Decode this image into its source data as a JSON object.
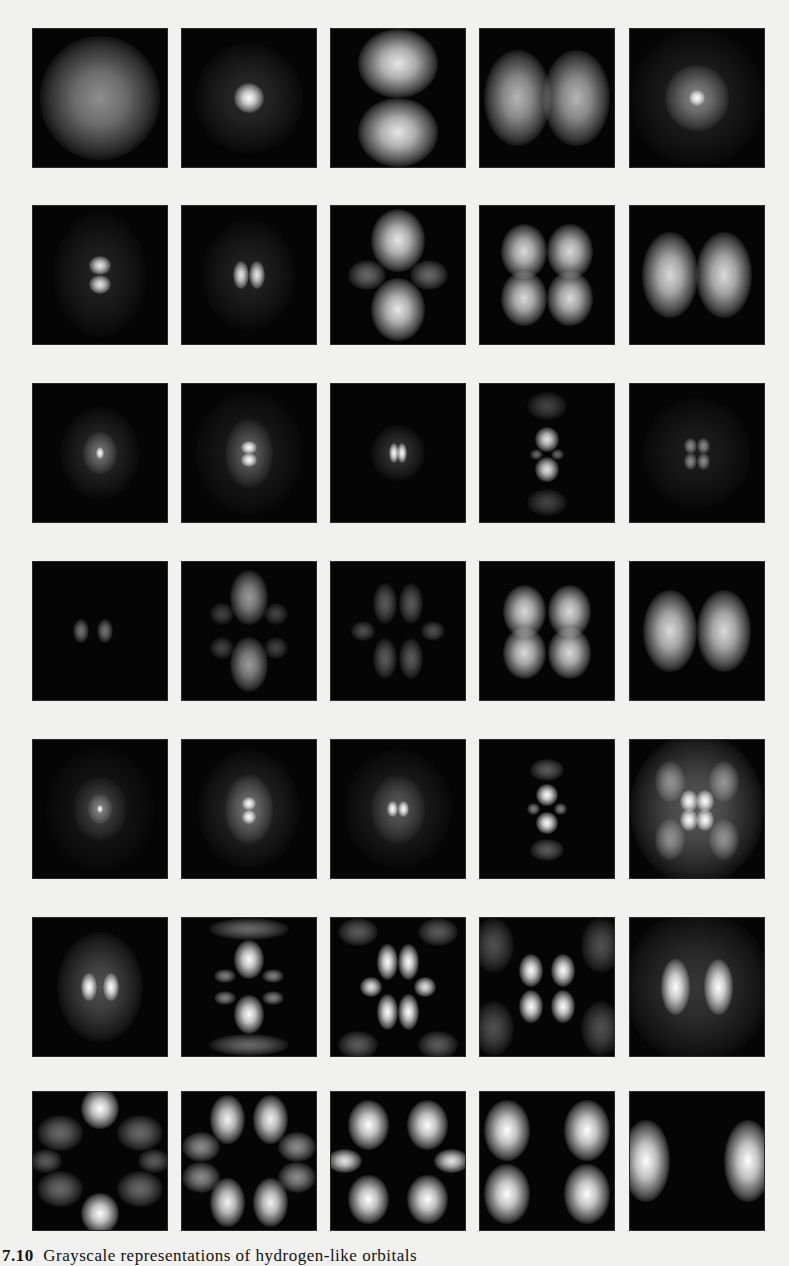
{
  "figure": {
    "caption_number": "7.10",
    "caption_text": "Grayscale representations of hydrogen-like orbitals",
    "rows": [
      {
        "row": 1,
        "cells": [
          "1s",
          "2s",
          "2p_z",
          "2p_x",
          "3s"
        ]
      },
      {
        "row": 2,
        "cells": [
          "3p_z",
          "3p_x",
          "3d_z2",
          "3d_xz",
          "3d_x2-y2"
        ]
      },
      {
        "row": 3,
        "cells": [
          "4s",
          "4p_z",
          "4p_x",
          "4d_z2",
          "4d_xz"
        ]
      },
      {
        "row": 4,
        "cells": [
          "4d_x2-y2",
          "4f_z3",
          "4f_xz2",
          "4f_xyz",
          "4f_x3"
        ]
      },
      {
        "row": 5,
        "cells": [
          "5s",
          "5p_z",
          "5p_x",
          "5d_z2",
          "5d_xz"
        ]
      },
      {
        "row": 6,
        "cells": [
          "5d_x2-y2",
          "5f_z3",
          "5f_xz2",
          "5f_xyz",
          "5f_x3"
        ]
      },
      {
        "row": 7,
        "cells": [
          "5g_z4",
          "5g_xz3",
          "5g_x2z2",
          "5g_xyz2",
          "5g_x4"
        ]
      }
    ],
    "colors": {
      "background": "#f1f1ef",
      "cell_background": "#050505",
      "glow": "#ffffff"
    }
  }
}
